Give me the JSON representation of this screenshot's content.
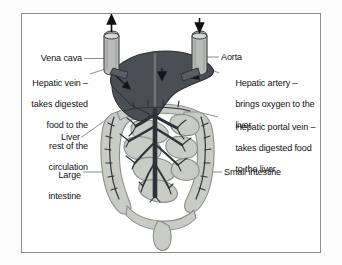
{
  "diagram": {
    "type": "anatomical-illustration",
    "colors": {
      "page_background": "#fdfdfd",
      "frame_border": "#8d8d8d",
      "liver_fill": "#4b4e55",
      "liver_outline": "#2a2c31",
      "intestine_fill": "#c9cbc6",
      "intestine_outline": "#8b8d88",
      "vessel_dark": "#2f3238",
      "vessel_mid": "#5a5d63",
      "tube_fill": "#b9bbb8",
      "leader_line": "#6f6f6f",
      "text": "#111111"
    },
    "structures": [
      {
        "name": "liver",
        "shade": "dark-grey"
      },
      {
        "name": "large-intestine",
        "shade": "light-grey"
      },
      {
        "name": "small-intestine",
        "shade": "light-grey"
      },
      {
        "name": "vena-cava-tube",
        "flow_arrow": "up"
      },
      {
        "name": "aorta-tube",
        "flow_arrow": "down"
      },
      {
        "name": "hepatic-portal-vein-tree",
        "shade": "dark"
      }
    ]
  },
  "labels": {
    "vena_cava": {
      "text": "Vena cava",
      "bold": false,
      "align": "right"
    },
    "hepatic_vein": {
      "heading": "Hepatic vein –",
      "line1": "takes digested",
      "line2": "food to the",
      "line3": "rest of the",
      "line4": "circulation",
      "bold_heading": true,
      "align": "right"
    },
    "liver": {
      "text": "Liver",
      "bold": false,
      "align": "right"
    },
    "large_intestine": {
      "line1": "Large",
      "line2": "intestine",
      "bold": false,
      "align": "right"
    },
    "aorta": {
      "text": "Aorta",
      "bold": false,
      "align": "left"
    },
    "hepatic_artery": {
      "heading": "Hepatic artery –",
      "line1": "brings oxygen to the",
      "line2": "liver",
      "bold_heading": true,
      "align": "left"
    },
    "hepatic_portal_vein": {
      "heading": "Hepatic portal vein –",
      "line1": "takes digested food",
      "line2": "to the liver",
      "bold_heading": true,
      "align": "left"
    },
    "small_intestine": {
      "text": "Small intestine",
      "bold": false,
      "align": "left"
    }
  }
}
